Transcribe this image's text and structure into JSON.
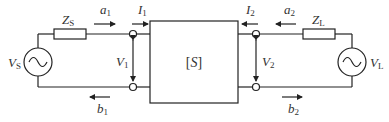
{
  "diagram": {
    "network_label": "[S]",
    "network_label_parts": {
      "open": "[",
      "symbol": "S",
      "close": "]"
    },
    "labels": {
      "source_voltage": {
        "main": "V",
        "sub": "S"
      },
      "source_impedance": {
        "main": "Z",
        "sub": "S"
      },
      "load_voltage": {
        "main": "V",
        "sub": "L"
      },
      "load_impedance": {
        "main": "Z",
        "sub": "L"
      },
      "incident_wave_1": {
        "main": "a",
        "sub": "1"
      },
      "reflected_wave_1": {
        "main": "b",
        "sub": "1"
      },
      "incident_wave_2": {
        "main": "a",
        "sub": "2"
      },
      "reflected_wave_2": {
        "main": "b",
        "sub": "2"
      },
      "current_1": {
        "main": "I",
        "sub": "1"
      },
      "current_2": {
        "main": "I",
        "sub": "2"
      },
      "port_voltage_1": {
        "main": "V",
        "sub": "1"
      },
      "port_voltage_2": {
        "main": "V",
        "sub": "2"
      }
    },
    "source_symbol": "~"
  }
}
